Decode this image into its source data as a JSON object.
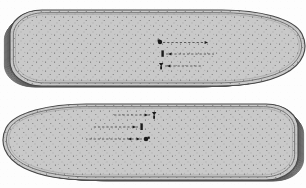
{
  "document": {
    "title": "Shoe Insole Size-Grading Technical Drawing",
    "kind": "scanned-line-drawing",
    "background_color": "#fdfdfd",
    "width": 306,
    "height": 188
  },
  "palette": {
    "paper": "#fdfdfd",
    "insole_fill": "#c9c9c9",
    "insole_fill_light": "#d4d4d4",
    "nested_fill": "#c2c2c2",
    "outline_dark": "#4a4a4a",
    "outline_mid": "#6e6e6e",
    "outline_light": "#8e8e8e",
    "speckle": "#3c3c3c",
    "annotation": "#1a1a1a",
    "leader_line": "#2b2b2b"
  },
  "figures": [
    {
      "id": "insole-upper",
      "label": "Upper insole outline",
      "orientation": "heel-left-toe-right",
      "heel_side": "left",
      "toe_side": "right",
      "bounds": {
        "x": 8,
        "y": 6,
        "width": 292,
        "height": 80
      },
      "body_fill": "#c9c9c9",
      "outline_color": "#4a4a4a",
      "has_inner_outline": true,
      "has_speckle_texture": true,
      "nested_ring_count": 12,
      "nested_ring_side": "toe"
    },
    {
      "id": "insole-lower",
      "label": "Lower insole outline (mirrored pair)",
      "orientation": "toe-left-heel-right",
      "heel_side": "right",
      "toe_side": "left",
      "bounds": {
        "x": 8,
        "y": 100,
        "width": 292,
        "height": 80
      },
      "body_fill": "#c9c9c9",
      "outline_color": "#4a4a4a",
      "has_inner_outline": true,
      "has_speckle_texture": true,
      "nested_ring_count": 12,
      "nested_ring_side": "toe"
    }
  ],
  "annotations": {
    "description": "Small dimension callouts with dashed leader lines across the graded toe contours",
    "upper": [
      {
        "id": "u1",
        "marker": "dimension-mark",
        "x": 158,
        "y": 43,
        "leader_direction": "right",
        "leader_length": 46
      },
      {
        "id": "u2",
        "marker": "dimension-mark",
        "x": 161,
        "y": 54,
        "leader_direction": "right",
        "leader_length": 52
      },
      {
        "id": "u3",
        "marker": "dimension-mark",
        "x": 159,
        "y": 66,
        "leader_direction": "right",
        "leader_length": 40
      }
    ],
    "lower": [
      {
        "id": "l1",
        "marker": "dimension-mark",
        "x": 148,
        "y": 116,
        "leader_direction": "left",
        "leader_length": 44
      },
      {
        "id": "l2",
        "marker": "dimension-mark",
        "x": 141,
        "y": 128,
        "leader_direction": "left",
        "leader_length": 50
      },
      {
        "id": "l3",
        "marker": "dimension-mark",
        "x": 143,
        "y": 140,
        "leader_direction": "left",
        "leader_length": 56
      }
    ]
  },
  "legend": {
    "visible_text": "none-legible",
    "note": "Callout text in the source scan is below resolution and not transcribable"
  }
}
